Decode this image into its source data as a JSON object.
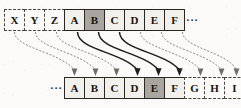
{
  "diagram": {
    "type": "sequence-shift-mapping",
    "top_row": {
      "name": "source-sequence",
      "cells": [
        {
          "label": "X",
          "style": "dashed",
          "highlighted": false
        },
        {
          "label": "Y",
          "style": "dashed",
          "highlighted": false
        },
        {
          "label": "Z",
          "style": "dashed",
          "highlighted": false
        },
        {
          "label": "A",
          "style": "solid",
          "highlighted": false
        },
        {
          "label": "B",
          "style": "solid",
          "highlighted": true
        },
        {
          "label": "C",
          "style": "solid",
          "highlighted": false
        },
        {
          "label": "D",
          "style": "solid",
          "highlighted": false
        },
        {
          "label": "E",
          "style": "solid",
          "highlighted": false
        },
        {
          "label": "F",
          "style": "solid",
          "highlighted": false
        }
      ],
      "trailing_ellipsis": "···"
    },
    "bottom_row": {
      "name": "target-sequence",
      "leading_ellipsis": "···",
      "cells": [
        {
          "label": "A",
          "style": "solid",
          "highlighted": false
        },
        {
          "label": "B",
          "style": "solid",
          "highlighted": false
        },
        {
          "label": "C",
          "style": "solid",
          "highlighted": false
        },
        {
          "label": "D",
          "style": "solid",
          "highlighted": false
        },
        {
          "label": "E",
          "style": "solid",
          "highlighted": true
        },
        {
          "label": "F",
          "style": "solid",
          "highlighted": false
        },
        {
          "label": "G",
          "style": "dashed",
          "highlighted": false
        },
        {
          "label": "H",
          "style": "dashed",
          "highlighted": false
        },
        {
          "label": "I",
          "style": "dashed",
          "highlighted": false
        }
      ]
    },
    "mappings": [
      {
        "from": "X",
        "to": "A",
        "style": "dashed"
      },
      {
        "from": "Y",
        "to": "B",
        "style": "dashed"
      },
      {
        "from": "Z",
        "to": "C",
        "style": "dashed"
      },
      {
        "from": "A",
        "to": "D",
        "style": "solid"
      },
      {
        "from": "B",
        "to": "E",
        "style": "solid"
      },
      {
        "from": "C",
        "to": "F",
        "style": "solid"
      },
      {
        "from": "D",
        "to": "G",
        "style": "dashed"
      },
      {
        "from": "E",
        "to": "H",
        "style": "dashed"
      },
      {
        "from": "F",
        "to": "I",
        "style": "dashed"
      }
    ],
    "colors": {
      "cell_fill": "#f2f0ec",
      "cell_highlight": "#a9a69f",
      "cell_border": "#2a2723",
      "background": "#fbfaf8",
      "arrow_solid": "#201d1a",
      "arrow_dashed": "#8d8983"
    }
  }
}
